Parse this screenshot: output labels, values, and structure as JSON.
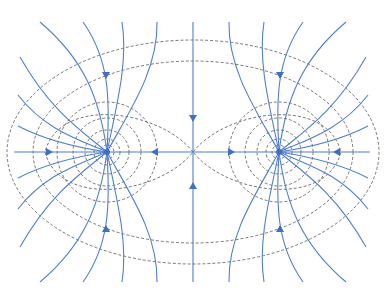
{
  "diagram": {
    "charges": [
      {
        "id": "left",
        "x": 107,
        "y": 152
      },
      {
        "id": "right",
        "x": 279,
        "y": 152
      }
    ],
    "saddle_point": {
      "x": 193,
      "y": 152
    },
    "colors": {
      "field_line": "#4f7fd0",
      "equipotential": "#555555",
      "charge": "#3f6fc4",
      "background": "#ffffff"
    },
    "legend": {
      "field_lines": "solid",
      "equipotentials": "dashed"
    }
  }
}
